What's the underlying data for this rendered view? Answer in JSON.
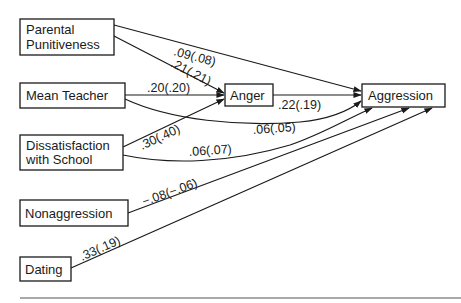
{
  "diagram": {
    "type": "path-diagram",
    "nodes": [
      {
        "id": "parental",
        "lines": [
          "Parental",
          "Punitiveness"
        ]
      },
      {
        "id": "teacher",
        "lines": [
          "Mean Teacher"
        ]
      },
      {
        "id": "dissatisfaction",
        "lines": [
          "Dissatisfaction",
          "with School"
        ]
      },
      {
        "id": "anger",
        "lines": [
          "Anger"
        ]
      },
      {
        "id": "aggression",
        "lines": [
          "Aggression"
        ]
      },
      {
        "id": "nonaggression",
        "lines": [
          "Nonaggression"
        ]
      },
      {
        "id": "dating",
        "lines": [
          "Dating"
        ]
      }
    ],
    "edges": [
      {
        "from": "parental",
        "to": "aggression",
        "label": ".09(.08)"
      },
      {
        "from": "parental",
        "to": "anger",
        "label": ".21(.21)"
      },
      {
        "from": "teacher",
        "to": "anger",
        "label": ".20(.20)"
      },
      {
        "from": "teacher",
        "to": "aggression",
        "label": ".06(.05)"
      },
      {
        "from": "dissatisfaction",
        "to": "anger",
        "label": ".30(.40)"
      },
      {
        "from": "dissatisfaction",
        "to": "aggression",
        "label": ".06(.07)"
      },
      {
        "from": "anger",
        "to": "aggression",
        "label": ".22(.19)"
      },
      {
        "from": "nonaggression",
        "to": "aggression",
        "label": "−.08(−.06)"
      },
      {
        "from": "dating",
        "to": "aggression",
        "label": ".33(.19)"
      }
    ],
    "colors": {
      "ink": "#1a1a1a",
      "background": "#ffffff"
    }
  }
}
